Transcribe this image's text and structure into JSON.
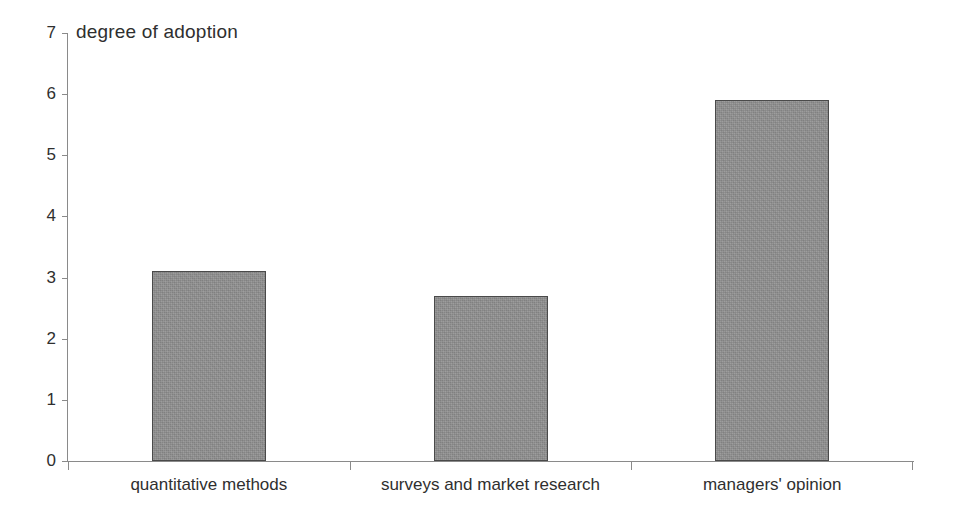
{
  "chart_data": {
    "type": "bar",
    "title": "degree of adoption",
    "xlabel": "",
    "ylabel": "",
    "categories": [
      "quantitative methods",
      "surveys and market research",
      "managers' opinion"
    ],
    "values": [
      3.1,
      2.7,
      5.9
    ],
    "ylim": [
      0,
      7
    ],
    "ytick_labels": [
      "0",
      "1",
      "2",
      "3",
      "4",
      "5",
      "6",
      "7"
    ],
    "ytick_values": [
      0,
      1,
      2,
      3,
      4,
      5,
      6,
      7
    ],
    "grid": false,
    "legend": null,
    "bar_fill_color": "#8e8e8e",
    "bar_edge_color": "#4a4a4a",
    "axis_color": "#8a8a8a",
    "background_color": "#ffffff",
    "text_color": "#2f2f2f"
  }
}
